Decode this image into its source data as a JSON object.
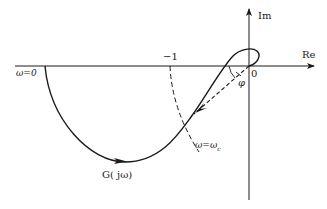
{
  "diagram": {
    "type": "nyquist-plot",
    "axes": {
      "real_label": "Re",
      "imag_label": "Im",
      "origin_label": "0"
    },
    "labels": {
      "minus_one": "−1",
      "omega_zero": "ω=0",
      "omega_c": "ω=ω",
      "omega_c_sub": "c",
      "curve_name": "G( jω)",
      "phase_angle": "φ"
    },
    "colors": {
      "stroke": "#1a1a1a",
      "background": "#ffffff"
    }
  }
}
